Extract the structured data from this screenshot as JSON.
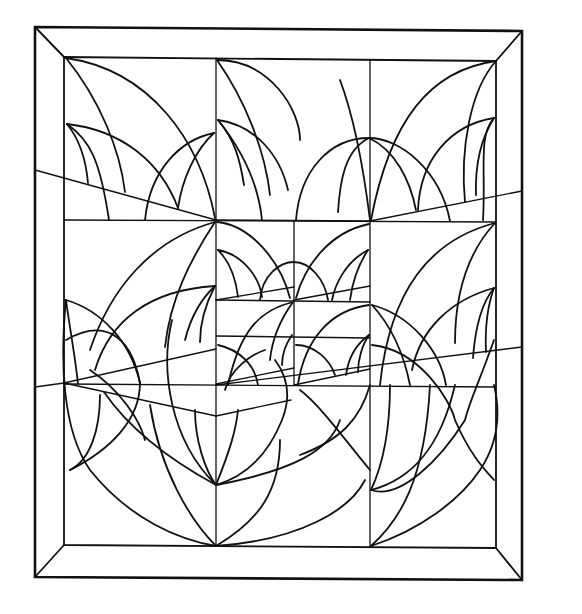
{
  "artwork": {
    "title": "",
    "description": "Black-and-white line drawing of a geometric abstract pattern inside a beveled picture frame",
    "colors": {
      "background": "#ffffff",
      "ink": "#111111"
    },
    "frame": {
      "outer": {
        "x1": 35,
        "y1": 27,
        "x2": 522,
        "y2": 580
      },
      "inner": {
        "x1": 64,
        "y1": 57,
        "x2": 496,
        "y2": 548
      }
    },
    "grid": {
      "vertical_lines_x": [
        216,
        370
      ],
      "horizontal_lines_y": [
        221,
        385
      ],
      "center_subgrid": {
        "x": [
          216,
          294,
          370
        ],
        "y": [
          221,
          300,
          336,
          385
        ]
      }
    }
  }
}
